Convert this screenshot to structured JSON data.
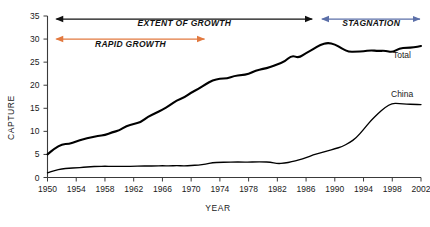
{
  "chart_data": {
    "type": "line",
    "title": "",
    "xlabel": "YEAR",
    "ylabel": "CAPTURE",
    "xlim": [
      1950,
      2002
    ],
    "ylim": [
      0,
      35
    ],
    "grid": false,
    "legend_position": "inline-right",
    "xticks": [
      1950,
      1954,
      1958,
      1962,
      1966,
      1970,
      1974,
      1978,
      1982,
      1986,
      1990,
      1994,
      1998,
      2002
    ],
    "yticks": [
      0,
      5,
      10,
      15,
      20,
      25,
      30,
      35
    ],
    "x": [
      1950,
      1951,
      1952,
      1953,
      1954,
      1955,
      1956,
      1957,
      1958,
      1959,
      1960,
      1961,
      1962,
      1963,
      1964,
      1965,
      1966,
      1967,
      1968,
      1969,
      1970,
      1971,
      1972,
      1973,
      1974,
      1975,
      1976,
      1977,
      1978,
      1979,
      1980,
      1981,
      1982,
      1983,
      1984,
      1985,
      1986,
      1987,
      1988,
      1989,
      1990,
      1991,
      1992,
      1993,
      1994,
      1995,
      1996,
      1997,
      1998,
      1999,
      2000,
      2001,
      2002
    ],
    "series": [
      {
        "name": "Total",
        "label": "Total",
        "color": "#000000",
        "values": [
          5.0,
          6.3,
          7.2,
          7.3,
          7.8,
          8.3,
          8.7,
          9.0,
          9.2,
          9.8,
          10.2,
          11.2,
          11.6,
          12.0,
          13.2,
          13.9,
          14.7,
          15.6,
          16.7,
          17.3,
          18.4,
          19.2,
          20.2,
          21.1,
          21.4,
          21.5,
          22.0,
          22.2,
          22.4,
          23.2,
          23.5,
          23.9,
          24.5,
          25.1,
          26.5,
          25.9,
          27.0,
          27.8,
          28.8,
          29.2,
          28.9,
          27.9,
          27.2,
          27.3,
          27.3,
          27.6,
          27.4,
          27.5,
          27.1,
          28.0,
          28.1,
          28.2,
          28.5
        ]
      },
      {
        "name": "China",
        "label": "China",
        "color": "#000000",
        "values": [
          1.0,
          1.5,
          1.9,
          2.0,
          2.1,
          2.2,
          2.35,
          2.4,
          2.45,
          2.4,
          2.4,
          2.4,
          2.45,
          2.5,
          2.5,
          2.5,
          2.55,
          2.5,
          2.6,
          2.5,
          2.6,
          2.7,
          2.9,
          3.2,
          3.3,
          3.3,
          3.35,
          3.35,
          3.3,
          3.4,
          3.4,
          3.3,
          3.0,
          3.1,
          3.4,
          3.8,
          4.3,
          4.9,
          5.3,
          5.8,
          6.2,
          6.7,
          7.5,
          8.6,
          10.4,
          12.3,
          13.8,
          15.2,
          16.1,
          16.0,
          15.9,
          15.85,
          15.8
        ]
      }
    ],
    "annotations": [
      {
        "id": "extent-of-growth",
        "label": "EXTENT OF GROWTH",
        "color": "#111111",
        "x_start": 1950,
        "x_end": 1987,
        "arrow": "both"
      },
      {
        "id": "stagnation",
        "label": "STAGNATION",
        "color": "#5b6fa8",
        "x_start": 1987,
        "x_end": 2002,
        "arrow": "both"
      },
      {
        "id": "rapid-growth",
        "label": "RAPID GROWTH",
        "color": "#e2793f",
        "x_start": 1950,
        "x_end": 1972,
        "arrow": "both"
      }
    ]
  }
}
